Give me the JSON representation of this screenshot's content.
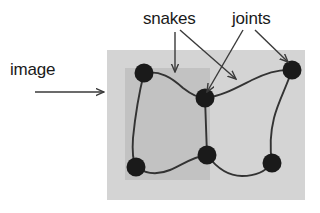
{
  "figure": {
    "background_color": "#ffffff",
    "labels": {
      "image": "image",
      "snakes": "snakes",
      "joints": "joints"
    },
    "regions": {
      "outer_image_rect": {
        "name": "image-region-outer",
        "color": "#d4d4d4",
        "x": 107,
        "y": 50,
        "width": 198,
        "height": 150
      },
      "inner_image_rect": {
        "name": "image-region-inner",
        "color": "#c2c2c2",
        "x": 125,
        "y": 68,
        "width": 85,
        "height": 112
      }
    },
    "joints": [
      {
        "name": "joint-top-left",
        "cx": 144,
        "cy": 73,
        "r": 9.5
      },
      {
        "name": "joint-center",
        "cx": 205,
        "cy": 98,
        "r": 9.5
      },
      {
        "name": "joint-top-right",
        "cx": 292,
        "cy": 70,
        "r": 9.5
      },
      {
        "name": "joint-bottom-left",
        "cx": 136,
        "cy": 167,
        "r": 9.5
      },
      {
        "name": "joint-bottom-center",
        "cx": 207,
        "cy": 155,
        "r": 9.5
      },
      {
        "name": "joint-bottom-right",
        "cx": 272,
        "cy": 163,
        "r": 9.5
      }
    ],
    "snakes": [
      {
        "name": "snake-top-left-to-center",
        "path": "M 144 73 C 160 70, 172 78, 183 88 C 192 95, 198 98, 205 98"
      },
      {
        "name": "snake-center-to-top-right",
        "path": "M 205 98 C 222 96, 236 88, 252 80 C 266 73, 280 69, 292 70"
      },
      {
        "name": "snake-top-left-to-bottom-left",
        "path": "M 144 73 C 138 97, 135 118, 133 138 C 132 152, 133 161, 136 167"
      },
      {
        "name": "snake-center-to-bottom-center",
        "path": "M 205 98 L 207 155"
      },
      {
        "name": "snake-bottom-left-to-bottom-ctr",
        "path": "M 136 167 C 146 174, 158 175, 170 170 C 182 165, 192 157, 207 155"
      },
      {
        "name": "snake-bottom-ctr-to-bottom-right",
        "path": "M 207 155 C 216 167, 228 176, 242 176 C 256 176, 266 171, 272 163"
      },
      {
        "name": "snake-top-right-to-bottom-right",
        "path": "M 292 70 C 286 88, 278 102, 274 118 C 270 134, 270 150, 272 163"
      }
    ],
    "arrows": [
      {
        "name": "arrow-image",
        "x1": 35,
        "y1": 92,
        "x2": 104,
        "y2": 92
      },
      {
        "name": "arrow-snakes-vertical",
        "x1": 175,
        "y1": 32,
        "x2": 175,
        "y2": 72
      },
      {
        "name": "arrow-snakes-diagonal",
        "x1": 180,
        "y1": 30,
        "x2": 236,
        "y2": 79
      },
      {
        "name": "arrow-joints-left",
        "x1": 243,
        "y1": 30,
        "x2": 207,
        "y2": 92
      },
      {
        "name": "arrow-joints-right",
        "x1": 255,
        "y1": 30,
        "x2": 288,
        "y2": 62
      }
    ],
    "text_positions": {
      "image": {
        "x": 10,
        "y": 75
      },
      "snakes": {
        "x": 143,
        "y": 24
      },
      "joints": {
        "x": 232,
        "y": 24
      }
    },
    "stroke_color": "#333333",
    "joint_color": "#1a1a1a"
  }
}
